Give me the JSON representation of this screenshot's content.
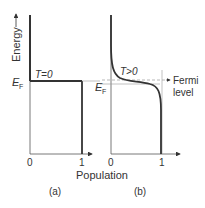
{
  "figure": {
    "y_axis_label": "Energy",
    "x_axis_label": "Population",
    "fermi_symbol": "E",
    "fermi_subscript": "F",
    "fermi_annotation_line1": "Fermi",
    "fermi_annotation_line2": "level",
    "colors": {
      "line": "#333333",
      "guide": "#999999"
    }
  },
  "panels": [
    {
      "caption": "(a)",
      "condition": "T=0",
      "x_ticks": [
        "0",
        "1"
      ]
    },
    {
      "caption": "(b)",
      "condition": "T>0",
      "x_ticks": [
        "0",
        "1"
      ]
    }
  ]
}
